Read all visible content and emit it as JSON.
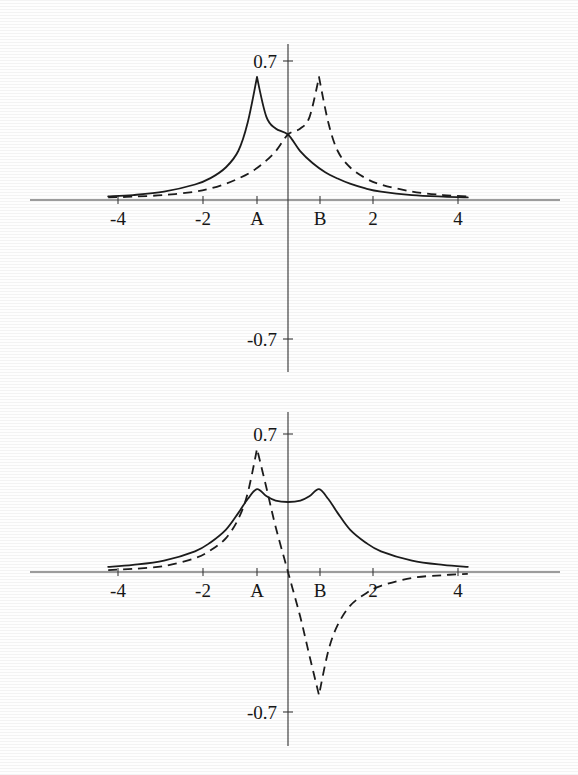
{
  "figure": {
    "background": "#fefefe",
    "ink": "#1c1c1c",
    "panels": [
      "top-panel",
      "bottom-panel"
    ]
  },
  "chart_data": [
    {
      "id": "top-panel",
      "type": "line",
      "title": "",
      "xlabel": "",
      "ylabel": "",
      "xlim": [
        -5.8,
        5.8
      ],
      "ylim": [
        -0.85,
        0.85
      ],
      "grid": false,
      "legend": "none",
      "xticks": [
        -4,
        -2,
        4
      ],
      "xticklabels": [
        "-4",
        "-2",
        "4"
      ],
      "special_xticks": [
        "A",
        "B"
      ],
      "special_xtick_values": [
        -1,
        1
      ],
      "yticks": [
        0.7,
        -0.7
      ],
      "yticklabels": [
        "0.7",
        "-0.7"
      ],
      "series": [
        {
          "name": "solid-curve-top",
          "style": "solid",
          "peak_x": -1,
          "peak_y": 0.62,
          "value_at_zero": 0.33,
          "x": [
            -5.8,
            -5.0,
            -4.0,
            -3.0,
            -2.5,
            -2.0,
            -1.6,
            -1.3,
            -1.0,
            -0.7,
            -0.4,
            0.0,
            0.4,
            0.8,
            1.2,
            1.6,
            2.0,
            2.5,
            3.0,
            4.0,
            5.0,
            5.8
          ],
          "values": [
            0.018,
            0.025,
            0.042,
            0.078,
            0.11,
            0.165,
            0.248,
            0.39,
            0.62,
            0.42,
            0.36,
            0.33,
            0.245,
            0.185,
            0.14,
            0.108,
            0.082,
            0.058,
            0.042,
            0.025,
            0.017,
            0.013
          ]
        },
        {
          "name": "dashed-curve-top",
          "style": "dashed",
          "peak_x": 1,
          "peak_y": 0.62,
          "value_at_zero": 0.33,
          "x": [
            -5.8,
            -5.0,
            -4.0,
            -3.0,
            -2.5,
            -2.0,
            -1.6,
            -1.2,
            -0.8,
            -0.4,
            0.0,
            0.4,
            0.7,
            1.0,
            1.3,
            1.6,
            2.0,
            2.5,
            3.0,
            4.0,
            5.0,
            5.8
          ],
          "values": [
            0.013,
            0.017,
            0.025,
            0.042,
            0.058,
            0.082,
            0.108,
            0.14,
            0.185,
            0.245,
            0.33,
            0.36,
            0.42,
            0.62,
            0.39,
            0.248,
            0.165,
            0.11,
            0.078,
            0.042,
            0.025,
            0.018
          ]
        }
      ]
    },
    {
      "id": "bottom-panel",
      "type": "line",
      "title": "",
      "xlabel": "",
      "ylabel": "",
      "xlim": [
        -5.8,
        5.8
      ],
      "ylim": [
        -0.85,
        0.85
      ],
      "grid": false,
      "legend": "none",
      "xticks": [
        -4,
        -2,
        4
      ],
      "xticklabels": [
        "-4",
        "-2",
        "4"
      ],
      "special_xticks": [
        "A",
        "B"
      ],
      "special_xtick_values": [
        -1,
        1
      ],
      "yticks": [
        0.7,
        -0.7
      ],
      "yticklabels": [
        "0.7",
        "-0.7"
      ],
      "series": [
        {
          "name": "solid-curve-bottom",
          "style": "solid",
          "description": "sum of the two peaks, local maxima at A and B with a shallow dip at 0",
          "peak_x": [
            -1,
            1
          ],
          "peak_y": 0.42,
          "value_at_zero": 0.355,
          "x": [
            -5.8,
            -5.0,
            -4.0,
            -3.0,
            -2.5,
            -2.0,
            -1.6,
            -1.3,
            -1.0,
            -0.7,
            -0.4,
            0.0,
            0.4,
            0.7,
            1.0,
            1.3,
            1.6,
            2.0,
            2.5,
            3.0,
            4.0,
            5.0,
            5.8
          ],
          "values": [
            0.026,
            0.036,
            0.058,
            0.105,
            0.15,
            0.215,
            0.3,
            0.37,
            0.42,
            0.385,
            0.362,
            0.355,
            0.362,
            0.385,
            0.42,
            0.37,
            0.3,
            0.215,
            0.15,
            0.105,
            0.058,
            0.036,
            0.026
          ]
        },
        {
          "name": "dashed-curve-bottom",
          "style": "dashed",
          "description": "difference of the two peaks, positive maximum at A, zero crossing at 0, negative minimum at B",
          "peak_x": -1,
          "peak_y": 0.62,
          "trough_x": 1,
          "trough_y": -0.62,
          "value_at_zero": 0.0,
          "x": [
            -5.8,
            -5.0,
            -4.0,
            -3.0,
            -2.5,
            -2.0,
            -1.6,
            -1.3,
            -1.0,
            -0.7,
            -0.4,
            0.0,
            0.4,
            0.7,
            1.0,
            1.3,
            1.6,
            2.0,
            2.5,
            3.0,
            4.0,
            5.0,
            5.8
          ],
          "values": [
            0.01,
            0.016,
            0.03,
            0.07,
            0.11,
            0.172,
            0.27,
            0.4,
            0.625,
            0.43,
            0.23,
            0.0,
            -0.23,
            -0.43,
            -0.625,
            -0.4,
            -0.27,
            -0.172,
            -0.11,
            -0.07,
            -0.03,
            -0.016,
            -0.01
          ]
        }
      ]
    }
  ]
}
